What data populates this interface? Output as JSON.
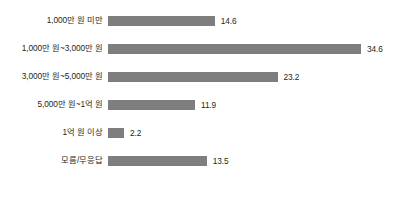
{
  "chart_data": {
    "type": "bar",
    "orientation": "horizontal",
    "title": "",
    "subtitle": "",
    "xlabel": "",
    "ylabel": "",
    "categories": [
      "1,000만 원 미만",
      "1,000만 원~3,000만 원",
      "3,000만 원~5,000만 원",
      "5,000만 원~1억 원",
      "1억 원 이상",
      "모름/무응답"
    ],
    "values": [
      14.6,
      34.6,
      23.2,
      11.9,
      2.2,
      13.5
    ],
    "value_labels": [
      "14.6",
      "34.6",
      "23.2",
      "11.9",
      "2.2",
      "13.5"
    ],
    "xlim": [
      0,
      34.6
    ],
    "grid": false,
    "legend": null,
    "bar_color": "#7e7e7e",
    "text_color": "#231f20",
    "background": "#ffffff"
  }
}
